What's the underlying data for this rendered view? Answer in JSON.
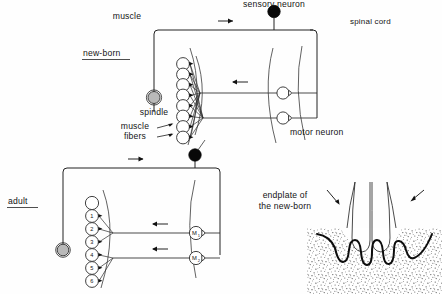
{
  "figure": {
    "background_color": "#fefefe",
    "ink_color": "#141414"
  },
  "panels": {
    "newborn": {
      "tag": "new-born",
      "labels": {
        "muscle": "muscle",
        "spindle": "spindle",
        "muscle_fibers_line1": "muscle",
        "muscle_fibers_line2": "fibers",
        "sensory_neuron": "sensory neuron",
        "spinal_cord": "spinal cord",
        "motor_neuron": "motor neuron"
      },
      "muscle_fiber_count": 8,
      "motor_neuron_count": 2
    },
    "adult": {
      "tag": "adult",
      "fiber_numbers": [
        "1",
        "2",
        "3",
        "4",
        "5",
        "6"
      ],
      "motor_neurons": [
        {
          "label": "M",
          "subscript": "1"
        },
        {
          "label": "M",
          "subscript": "2"
        }
      ],
      "muscle_fiber_count": 7
    },
    "endplate": {
      "caption_line1": "endplate of",
      "caption_line2": "the new-born"
    }
  }
}
